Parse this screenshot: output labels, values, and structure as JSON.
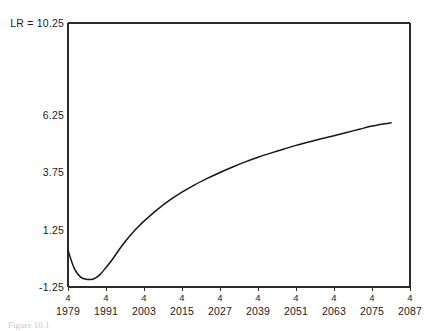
{
  "figure": {
    "caption": "Figure 10.1"
  },
  "chart_data": {
    "type": "line",
    "title": "",
    "xlabel": "",
    "ylabel": "",
    "axis_max_label": "LR = 10.25",
    "ylim": [
      -1.25,
      10.25
    ],
    "xlim": [
      1979,
      2087
    ],
    "grid": false,
    "legend": null,
    "ytick_labels": [
      "6.25",
      "3.75",
      "1.25",
      "-1.25"
    ],
    "ytick_values": [
      6.25,
      3.75,
      1.25,
      -1.25
    ],
    "xtick_labels": [
      "1979",
      "1991",
      "2003",
      "2015",
      "2027",
      "2039",
      "2051",
      "2063",
      "2075",
      "2087"
    ],
    "xtick_values": [
      1979,
      1991,
      2003,
      2015,
      2027,
      2039,
      2051,
      2063,
      2075,
      2087
    ],
    "xtick_sublabels": [
      "4",
      "4",
      "4",
      "4",
      "4",
      "4",
      "4",
      "4",
      "4",
      "4"
    ],
    "series": [
      {
        "name": "LR",
        "x": [
          1979,
          1981,
          1983,
          1985,
          1987,
          1989,
          1991,
          1993,
          1995,
          1997,
          1999,
          2001,
          2003,
          2007,
          2011,
          2015,
          2019,
          2023,
          2027,
          2031,
          2035,
          2039,
          2043,
          2047,
          2051,
          2055,
          2059,
          2063,
          2067,
          2071,
          2075,
          2079,
          2081
        ],
        "values": [
          0.35,
          -0.45,
          -0.82,
          -0.92,
          -0.9,
          -0.72,
          -0.4,
          -0.05,
          0.35,
          0.72,
          1.05,
          1.35,
          1.62,
          2.1,
          2.52,
          2.88,
          3.2,
          3.48,
          3.74,
          3.98,
          4.2,
          4.4,
          4.58,
          4.75,
          4.92,
          5.07,
          5.21,
          5.34,
          5.48,
          5.62,
          5.76,
          5.86,
          5.9
        ]
      }
    ]
  }
}
